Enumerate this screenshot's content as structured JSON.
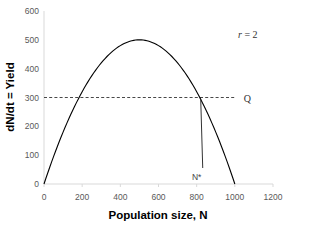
{
  "chart_data": {
    "type": "line",
    "title": "",
    "xlabel": "Population size, N",
    "ylabel": "dN/dt = Yield",
    "xlim": [
      0,
      1200
    ],
    "ylim": [
      0,
      600
    ],
    "x_ticks": [
      "0",
      "200",
      "400",
      "600",
      "800",
      "1000",
      "1200"
    ],
    "y_ticks": [
      "0",
      "100",
      "200",
      "300",
      "400",
      "500",
      "600"
    ],
    "grid": false,
    "legend": null,
    "series": [
      {
        "name": "Yield curve",
        "x": [
          0,
          100,
          200,
          300,
          400,
          500,
          600,
          700,
          800,
          900,
          1000
        ],
        "values": [
          0,
          180,
          320,
          420,
          480,
          500,
          480,
          420,
          320,
          180,
          0
        ],
        "color": "#000000"
      }
    ],
    "reference_lines": [
      {
        "type": "horizontal",
        "y": 300,
        "style": "dashed",
        "label": "Q",
        "x_start": 0,
        "x_end": 1000
      }
    ],
    "annotations": [
      {
        "text": "r = 2",
        "x": 900,
        "y": 550
      },
      {
        "text": "N*",
        "x": 816,
        "y": 30,
        "pointer_to": [
          816,
          300
        ]
      }
    ]
  }
}
